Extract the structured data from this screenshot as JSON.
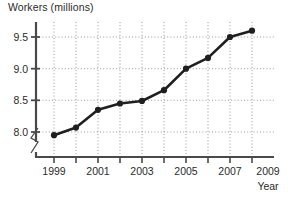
{
  "chart_data": {
    "type": "line",
    "title": "Workers (millions)",
    "ylabel": "Workers (millions)",
    "xlabel": "Year",
    "x": [
      1999,
      2000,
      2001,
      2002,
      2003,
      2004,
      2005,
      2006,
      2007,
      2008
    ],
    "values": [
      7.95,
      8.07,
      8.35,
      8.45,
      8.49,
      8.66,
      9.0,
      9.17,
      9.5,
      9.6
    ],
    "series": [
      {
        "name": "Workers",
        "values": [
          7.95,
          8.07,
          8.35,
          8.45,
          8.49,
          8.66,
          9.0,
          9.17,
          9.5,
          9.6
        ]
      }
    ],
    "xlim": [
      1999,
      2009
    ],
    "ylim": [
      7.75,
      9.75
    ],
    "y_ticks": [
      8.0,
      8.5,
      9.0,
      9.5
    ],
    "y_tick_labels": [
      "8.0",
      "8.5",
      "9.0",
      "9.5"
    ],
    "x_ticks": [
      1999,
      2000,
      2001,
      2002,
      2003,
      2004,
      2005,
      2006,
      2007,
      2008,
      2009
    ],
    "x_tick_labels": [
      "1999",
      "",
      "2001",
      "",
      "2003",
      "",
      "2005",
      "",
      "2007",
      "",
      "2009"
    ],
    "x_labeled_ticks": [
      "1999",
      "2001",
      "2003",
      "2005",
      "2007",
      "2009"
    ],
    "grid": true,
    "legend": "none",
    "axis_break": true,
    "axis_break_axis": "y",
    "marker": "filled-circle",
    "line_color": "#1f1f1f",
    "marker_color": "#1f1f1f",
    "grid_color": "#8c8c8c",
    "axis_color": "#4a4a4a"
  },
  "labels": {
    "y_caption": "Workers (millions)",
    "x_caption": "Year",
    "y_0": "8.0",
    "y_1": "8.5",
    "y_2": "9.0",
    "y_3": "9.5",
    "x_0": "1999",
    "x_1": "2001",
    "x_2": "2003",
    "x_3": "2005",
    "x_4": "2007",
    "x_5": "2009"
  }
}
